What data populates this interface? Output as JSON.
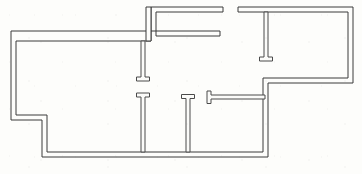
{
  "document": {
    "kind": "architectural-floor-plan",
    "title": "",
    "background_color": "#fdfdfb",
    "wall_line_color": "#3a3a3a",
    "wall_fill_color": "#fdfdfb",
    "canvas": {
      "width": 362,
      "height": 174
    }
  },
  "plan": {
    "description": "Single-level residential floor plan drawn as double-line walls with doorway gaps between rooms.",
    "outline_note": "Irregular L/T shaped perimeter with a stepped notch at the lower left and a stepped recess at the right center.",
    "walls": {
      "perimeter_outer": "M 11 31 L 220 31 L 220 36 L 151 36 L 151 7 L 223 7 L 223 12 L 156 12 L 156 41 L 16 41 L 16 115 L 47 115 L 47 152 L 268 152 L 268 78 L 353 78 L 353 7 L 238 7 L 238 12 L 348 12 L 348 73 L 263 73 L 263 147 L 42 147 L 42 110 L 11 110 Z",
      "perimeter_outer_simplified": "M 11 31 L 220 31 L 220 36 L 156 36 L 156 41 L 16 41 L 16 115 L 47 115 L 47 152 L 268 152 L 268 78 L 353 78 L 353 7 L 238 7 L 238 12 L 348 12 L 348 73 L 263 73 L 263 147 L 42 147 L 42 110 L 11 110 Z"
    },
    "segments": [
      {
        "id": "top-wall-left",
        "name": "north-wall-left-wing",
        "x1": 11,
        "y1": 31,
        "x2": 220,
        "y2": 36,
        "orientation": "horizontal"
      },
      {
        "id": "upper-bay-top",
        "name": "north-wall-upper-bay",
        "x1": 151,
        "y1": 7,
        "x2": 223,
        "y2": 12,
        "orientation": "horizontal"
      },
      {
        "id": "upper-bay-left",
        "name": "upper-bay-west-wall",
        "x1": 146,
        "y1": 7,
        "x2": 151,
        "y2": 41,
        "orientation": "vertical"
      },
      {
        "id": "right-wing-top",
        "name": "north-wall-right-wing",
        "x1": 238,
        "y1": 7,
        "x2": 353,
        "y2": 12,
        "orientation": "horizontal"
      },
      {
        "id": "right-wing-east",
        "name": "east-exterior-wall",
        "x1": 348,
        "y1": 7,
        "x2": 353,
        "y2": 83,
        "orientation": "vertical"
      },
      {
        "id": "right-wing-bottom",
        "name": "right-wing-south-wall",
        "x1": 266,
        "y1": 78,
        "x2": 353,
        "y2": 83,
        "orientation": "horizontal"
      },
      {
        "id": "mid-right-vertical",
        "name": "central-east-wall",
        "x1": 263,
        "y1": 78,
        "x2": 268,
        "y2": 157,
        "orientation": "vertical"
      },
      {
        "id": "west-exterior-upper",
        "name": "west-exterior-wall-upper",
        "x1": 11,
        "y1": 31,
        "x2": 16,
        "y2": 120,
        "orientation": "vertical"
      },
      {
        "id": "notch-horizontal",
        "name": "southwest-notch-wall",
        "x1": 11,
        "y1": 115,
        "x2": 47,
        "y2": 120,
        "orientation": "horizontal"
      },
      {
        "id": "notch-vertical",
        "name": "southwest-notch-return",
        "x1": 42,
        "y1": 115,
        "x2": 47,
        "y2": 157,
        "orientation": "vertical"
      },
      {
        "id": "bottom-wall",
        "name": "south-exterior-wall",
        "x1": 42,
        "y1": 152,
        "x2": 268,
        "y2": 157,
        "orientation": "horizontal"
      },
      {
        "id": "partition-a",
        "name": "interior-partition-upper-center",
        "x1": 141,
        "y1": 41,
        "x2": 145,
        "y2": 81,
        "orientation": "vertical"
      },
      {
        "id": "partition-b",
        "name": "interior-partition-lower-center",
        "x1": 141,
        "y1": 93,
        "x2": 145,
        "y2": 152,
        "orientation": "vertical"
      },
      {
        "id": "partition-c",
        "name": "interior-partition-lower-right",
        "x1": 186,
        "y1": 95,
        "x2": 190,
        "y2": 152,
        "orientation": "vertical"
      },
      {
        "id": "partition-d",
        "name": "interior-partition-right-wing",
        "x1": 264,
        "y1": 12,
        "x2": 268,
        "y2": 61,
        "orientation": "vertical"
      },
      {
        "id": "partition-e",
        "name": "interior-partition-horizontal-center",
        "x1": 207,
        "y1": 95,
        "x2": 265,
        "y2": 99,
        "orientation": "horizontal"
      }
    ],
    "door_openings": [
      {
        "id": "door-upper-center",
        "name": "doorway-upper-center-room",
        "between": [
          "partition-a",
          "partition-b"
        ],
        "x": 143,
        "y_top": 81,
        "y_bottom": 93,
        "width_px": 12
      },
      {
        "id": "door-lower-right",
        "name": "doorway-lower-right-room",
        "between": [
          "partition-b",
          "partition-c"
        ],
        "x": 186,
        "y_top": 95,
        "y_bottom": 95,
        "width_px": 0
      },
      {
        "id": "door-right-wing",
        "name": "doorway-right-wing",
        "between": [
          "partition-d",
          "right-wing-bottom"
        ],
        "x": 266,
        "y_top": 61,
        "y_bottom": 78,
        "width_px": 17
      },
      {
        "id": "door-north-entry",
        "name": "doorway-north-entry",
        "between": [
          "upper-bay-top",
          "right-wing-top"
        ],
        "x_left": 223,
        "x_right": 238,
        "y": 9,
        "width_px": 15
      }
    ],
    "wall_end_caps": [
      {
        "id": "cap-a",
        "name": "wall-end-cap-upper-center",
        "cx": 143,
        "cy": 79,
        "w": 14,
        "h": 4,
        "orientation": "horizontal"
      },
      {
        "id": "cap-b",
        "name": "wall-end-cap-lower-center",
        "cx": 143,
        "cy": 95,
        "w": 14,
        "h": 4,
        "orientation": "horizontal"
      },
      {
        "id": "cap-c",
        "name": "wall-end-cap-lower-right",
        "cx": 188,
        "cy": 96,
        "w": 14,
        "h": 4,
        "orientation": "horizontal"
      },
      {
        "id": "cap-d",
        "name": "wall-end-cap-right-wing",
        "cx": 266,
        "cy": 60,
        "w": 14,
        "h": 4,
        "orientation": "horizontal"
      },
      {
        "id": "cap-e",
        "name": "wall-end-cap-center-horizontal",
        "cx": 209,
        "cy": 97,
        "w": 4,
        "h": 13,
        "orientation": "vertical"
      }
    ]
  }
}
